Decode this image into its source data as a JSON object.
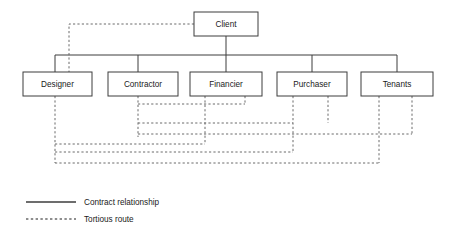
{
  "diagram": {
    "type": "organizational-contract-chart",
    "title": "",
    "root_node": {
      "id": "client",
      "label": "Client",
      "x": 194,
      "y": 12,
      "width": 64,
      "height": 24
    },
    "nodes": [
      {
        "id": "designer",
        "label": "Designer",
        "x": 23,
        "y": 72,
        "width": 69,
        "height": 24
      },
      {
        "id": "contractor",
        "label": "Contractor",
        "x": 108,
        "y": 72,
        "width": 70,
        "height": 24
      },
      {
        "id": "financier",
        "label": "Financier",
        "x": 190,
        "y": 72,
        "width": 72,
        "height": 24
      },
      {
        "id": "purchaser",
        "label": "Purchaser",
        "x": 277,
        "y": 72,
        "width": 70,
        "height": 24
      },
      {
        "id": "tenants",
        "label": "Tenants",
        "x": 361,
        "y": 72,
        "width": 72,
        "height": 24
      }
    ],
    "contract_relationships": [
      {
        "from": "client",
        "to": "designer"
      },
      {
        "from": "client",
        "to": "contractor"
      },
      {
        "from": "client",
        "to": "financier"
      },
      {
        "from": "client",
        "to": "purchaser"
      },
      {
        "from": "client",
        "to": "tenants"
      }
    ],
    "tortious_routes": [
      {
        "from": "client",
        "to": "designer"
      },
      {
        "from": "contractor",
        "to": "financier"
      },
      {
        "from": "contractor",
        "to": "purchaser"
      },
      {
        "from": "contractor",
        "to": "tenants"
      },
      {
        "from": "financier",
        "to": "purchaser"
      },
      {
        "from": "financier",
        "to": "tenants"
      },
      {
        "from": "purchaser",
        "to": "tenants"
      },
      {
        "from": "designer",
        "to": "financier"
      },
      {
        "from": "designer",
        "to": "purchaser"
      },
      {
        "from": "designer",
        "to": "tenants"
      }
    ],
    "solid_paths": [
      "M 226 36 L 226 72",
      "M 55 55 L 397 55",
      "M 55 55 L 55 72",
      "M 138 55 L 138 72",
      "M 312 55 L 312 72",
      "M 397 55 L 397 72"
    ],
    "dashed_paths": [
      "M 194 24 L 69 24 L 69 72",
      "M 138 96 L 138 137",
      "M 138 104 L 245 104",
      "M 138 123 L 293 123",
      "M 138 134 L 412 134",
      "M 205 96 L 205 144",
      "M 245 96 L 245 104",
      "M 293 96 L 293 152",
      "M 328 96 L 328 123",
      "M 379 96 L 379 163",
      "M 412 96 L 412 134",
      "M 55 96 L 55 163",
      "M 55 144 L 205 144",
      "M 55 152 L 293 152",
      "M 55 163 L 379 163"
    ]
  },
  "legend": {
    "title": "",
    "items": [
      {
        "id": "contract-relationship",
        "label": "Contract relationship",
        "style": "solid",
        "color": "#3c3c3c",
        "sample_x1": 26,
        "sample_x2": 76,
        "y": 202
      },
      {
        "id": "tortious-route",
        "label": "Tortious route",
        "style": "dashed",
        "color": "#6a6a6a",
        "sample_x1": 26,
        "sample_x2": 76,
        "y": 219
      }
    ],
    "label_x": 84
  },
  "colors": {
    "background": "#ffffff",
    "node_stroke": "#3c3c3c",
    "node_fill": "#ffffff",
    "text": "#1a1a1a",
    "solid_line": "#3c3c3c",
    "dashed_line": "#6a6a6a"
  }
}
